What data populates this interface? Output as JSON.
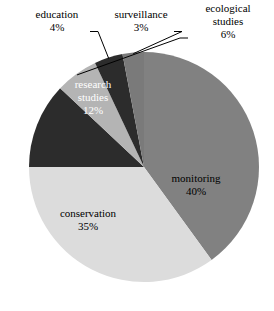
{
  "chart_data": {
    "type": "pie",
    "title": "",
    "subtitle": "",
    "xlabel": "",
    "ylabel": "",
    "grid": false,
    "legend": "none",
    "label_format": "name + percent",
    "start_angle_deg": -90,
    "direction": "clockwise",
    "categories": [
      "monitoring",
      "conservation",
      "research studies",
      "ecological studies",
      "education",
      "surveillance"
    ],
    "values": [
      40,
      35,
      12,
      6,
      4,
      3
    ],
    "slices": [
      {
        "name": "monitoring",
        "label": "monitoring",
        "percent_label": "40%",
        "value": 40,
        "color": "#818181",
        "label_placement": "inside",
        "label_x": 196,
        "label_y": 186,
        "text_color": "dark"
      },
      {
        "name": "conservation",
        "label": "conservation",
        "percent_label": "35%",
        "value": 35,
        "color": "#dcdcdc",
        "label_placement": "inside",
        "label_x": 88,
        "label_y": 221,
        "text_color": "dark"
      },
      {
        "name": "research studies",
        "label_line1": "research",
        "label_line2": "studies",
        "percent_label": "12%",
        "value": 12,
        "color": "#2c2c2c",
        "label_placement": "inside",
        "label_x": 93,
        "label_y": 98,
        "text_color": "light"
      },
      {
        "name": "ecological studies",
        "label_line1": "ecological",
        "label_line2": "studies",
        "percent_label": "6%",
        "value": 6,
        "color": "#b4b4b4",
        "label_placement": "outside",
        "label_x": 228,
        "label_y": 22,
        "text_color": "dark"
      },
      {
        "name": "education",
        "label": "education",
        "percent_label": "4%",
        "value": 4,
        "color": "#2c2c2c",
        "label_placement": "outside",
        "label_x": 57,
        "label_y": 22,
        "text_color": "dark"
      },
      {
        "name": "surveillance",
        "label": "surveillance",
        "percent_label": "3%",
        "value": 3,
        "color": "#7a7a7a",
        "label_placement": "outside",
        "label_x": 141,
        "label_y": 22,
        "text_color": "dark"
      }
    ],
    "geometry": {
      "center_x": 144,
      "center_y": 167,
      "radius": 115
    },
    "background_color": "#ffffff"
  }
}
